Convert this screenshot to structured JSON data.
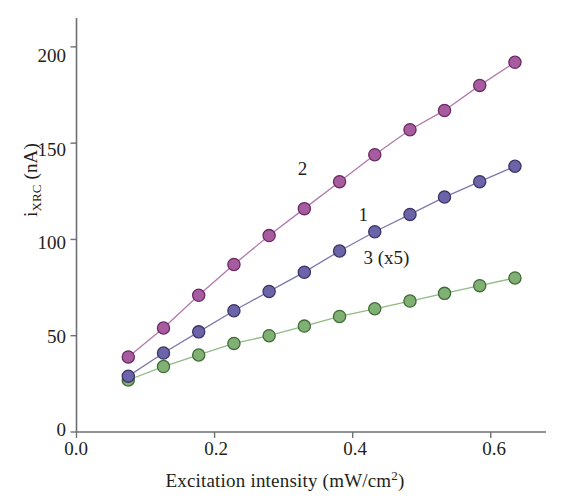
{
  "chart_data": {
    "type": "line",
    "title": "",
    "subtitle": "",
    "xlabel_text": "Excitation intensity (mW/cm",
    "xlabel_sup": "2",
    "xlabel_tail": ")",
    "ylabel_main": "i",
    "ylabel_sub": "XRC",
    "ylabel_tail": " (nA)",
    "xlabel": "Excitation intensity (mW/cm2)",
    "ylabel": "iXRC (nA)",
    "xlim": [
      0.0,
      0.68
    ],
    "ylim": [
      0,
      215
    ],
    "xticks": [
      0.0,
      0.2,
      0.4,
      0.6
    ],
    "xtick_labels": [
      "0.0",
      "0.2",
      "0.4",
      "0.6"
    ],
    "yticks": [
      0,
      50,
      100,
      150,
      200
    ],
    "ytick_labels": [
      "0",
      "50",
      "100",
      "150",
      "200"
    ],
    "grid": false,
    "legend_position": "inline-annotations",
    "marker": "filled-circle",
    "x": [
      0.075,
      0.126,
      0.177,
      0.228,
      0.279,
      0.33,
      0.381,
      0.432,
      0.483,
      0.533,
      0.584,
      0.635
    ],
    "series": [
      {
        "name": "1",
        "annotation": "1",
        "annotation_x": 0.423,
        "annotation_y": 112,
        "color": "#6B64A8",
        "line_color": "#7E78B0",
        "marker_edge": "#3C3566",
        "values": [
          29,
          41,
          52,
          63,
          73,
          83,
          94,
          104,
          113,
          122,
          130,
          138
        ]
      },
      {
        "name": "2",
        "annotation": "2",
        "annotation_x": 0.335,
        "annotation_y": 136,
        "color": "#A75CA0",
        "line_color": "#B07AAC",
        "marker_edge": "#6B2A64",
        "values": [
          39,
          54,
          71,
          87,
          102,
          116,
          130,
          144,
          157,
          167,
          180,
          192
        ]
      },
      {
        "name": "3 (x5)",
        "annotation": "3 (x5)",
        "annotation_x": 0.43,
        "annotation_y": 90,
        "color": "#80B073",
        "line_color": "#8FBB80",
        "marker_edge": "#3F6B37",
        "values": [
          27,
          34,
          40,
          46,
          50,
          55,
          60,
          64,
          68,
          72,
          76,
          80
        ]
      }
    ],
    "axis_color": "#6F7073",
    "text_color": "#231f20"
  }
}
